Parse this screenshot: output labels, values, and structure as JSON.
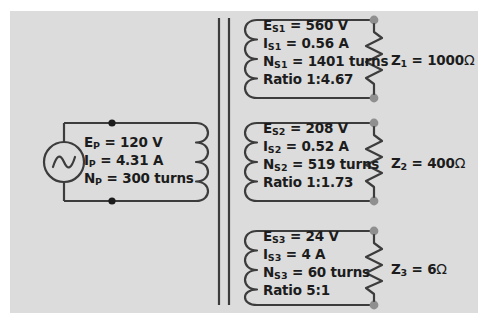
{
  "diagram": {
    "panel_color": "#dcdcdc",
    "page_color": "#ffffff",
    "wire_color": "#3c3c3c",
    "node_color": "#8f8f8f",
    "text_color": "#1c1c1c"
  },
  "primary": {
    "source_icon": "ac-source-icon",
    "lines": [
      {
        "symbol": "E",
        "sub": "P",
        "eq": " = 120 V"
      },
      {
        "symbol": "I",
        "sub": "P",
        "eq": " = 4.31 A"
      },
      {
        "symbol": "N",
        "sub": "P",
        "eq": " = 300 turns"
      }
    ],
    "voltage": "120 V",
    "current": "4.31 A",
    "turns": "300 turns"
  },
  "secondaries": [
    {
      "id": "secondary-1",
      "lines": [
        {
          "symbol": "E",
          "sub": "S1",
          "eq": " = 560 V"
        },
        {
          "symbol": "I",
          "sub": "S1",
          "eq": " = 0.56 A"
        },
        {
          "symbol": "N",
          "sub": "S1",
          "eq": " = 1401 turns"
        },
        {
          "symbol": "Ratio",
          "sub": "",
          "eq": " 1:4.67"
        }
      ],
      "voltage": "560 V",
      "current": "0.56 A",
      "turns": "1401 turns",
      "ratio": "1:4.67",
      "load": {
        "symbol": "Z",
        "sub": "1",
        "value": " = 1000",
        "unit": "Ω"
      }
    },
    {
      "id": "secondary-2",
      "lines": [
        {
          "symbol": "E",
          "sub": "S2",
          "eq": " = 208 V"
        },
        {
          "symbol": "I",
          "sub": "S2",
          "eq": " = 0.52 A"
        },
        {
          "symbol": "N",
          "sub": "S2",
          "eq": " = 519 turns"
        },
        {
          "symbol": "Ratio",
          "sub": "",
          "eq": " 1:1.73"
        }
      ],
      "voltage": "208 V",
      "current": "0.52 A",
      "turns": "519 turns",
      "ratio": "1:1.73",
      "load": {
        "symbol": "Z",
        "sub": "2",
        "value": " = 400",
        "unit": "Ω"
      }
    },
    {
      "id": "secondary-3",
      "lines": [
        {
          "symbol": "E",
          "sub": "S3",
          "eq": " = 24 V"
        },
        {
          "symbol": "I",
          "sub": "S3",
          "eq": " = 4 A"
        },
        {
          "symbol": "N",
          "sub": "S3",
          "eq": " = 60 turns"
        },
        {
          "symbol": "Ratio",
          "sub": "",
          "eq": " 5:1"
        }
      ],
      "voltage": "24 V",
      "current": "4 A",
      "turns": "60 turns",
      "ratio": "5:1",
      "load": {
        "symbol": "Z",
        "sub": "3",
        "value": " = 6",
        "unit": "Ω"
      }
    }
  ]
}
